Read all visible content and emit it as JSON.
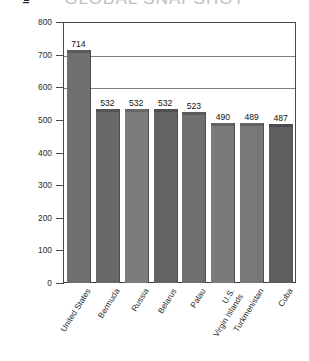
{
  "chart_data": {
    "type": "bar",
    "title": "GLOBAL SNAPSHOT",
    "xlabel": "",
    "ylabel": "Individuals Incarcerated (per 100 000 population)",
    "ylim": [
      0,
      800
    ],
    "yticks": [
      0,
      100,
      200,
      300,
      400,
      500,
      600,
      700,
      800
    ],
    "ytick_labels": [
      "0",
      "100",
      "200",
      "300",
      "400",
      "500",
      "600",
      "700",
      "800"
    ],
    "gridlines": [
      600,
      700,
      800
    ],
    "grid": true,
    "legend": null,
    "categories": [
      "United States",
      "Bermuda",
      "Russia",
      "Belarus",
      "Palau",
      "U.S.\nVirgin Islands",
      "Turkmenistan",
      "Cuba"
    ],
    "values": [
      714,
      532,
      532,
      532,
      523,
      490,
      489,
      487
    ],
    "value_labels": [
      "714",
      "532",
      "532",
      "532",
      "523",
      "490",
      "489",
      "487"
    ],
    "bar_colors": [
      "#6f6f6f",
      "#686868",
      "#7c7c7c",
      "#636363",
      "#6f6f6f",
      "#7a7a7a",
      "#787878",
      "#5e5e5e"
    ],
    "bar_top_colors": [
      "#5a5a5a",
      "#555555",
      "#676767",
      "#4f4f4f",
      "#5a5a5a",
      "#646464",
      "#626262",
      "#4b4b4b"
    ]
  },
  "colors": {
    "background": "#ffffff",
    "axis": "#4a4a4a",
    "gridline": "#7d7d7d",
    "text": "#1a1a1a",
    "title": "#bdbdbd"
  }
}
